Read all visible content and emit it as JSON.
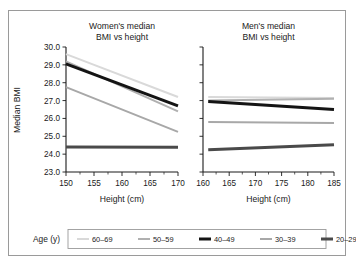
{
  "figure": {
    "panels": [
      {
        "id": "women",
        "title_line1": "Women's median",
        "title_line2": "BMI vs height",
        "xlabel": "Height (cm)",
        "xticks": [
          "150",
          "155",
          "160",
          "165",
          "170"
        ]
      },
      {
        "id": "men",
        "title_line1": "Men's median",
        "title_line2": "BMI vs height",
        "xlabel": "Height (cm)",
        "xticks": [
          "160",
          "165",
          "170",
          "175",
          "180",
          "185"
        ]
      }
    ],
    "ylabel": "Median BMI",
    "yticks": [
      "30.0",
      "29.0",
      "28.0",
      "27.0",
      "26.0",
      "25.0",
      "24.0",
      "23.0"
    ],
    "legend": {
      "title": "Age (y)",
      "entries": [
        {
          "label": "60–69",
          "color": "#d9d9d9",
          "width": 2.0
        },
        {
          "label": "50–59",
          "color": "#b0b0b0",
          "width": 2.0
        },
        {
          "label": "40–49",
          "color": "#141414",
          "width": 3.0
        },
        {
          "label": "30–39",
          "color": "#a8a8a8",
          "width": 2.0
        },
        {
          "label": "20–29",
          "color": "#4a4a4a",
          "width": 3.0
        }
      ]
    }
  },
  "chart_data": {
    "type": "line",
    "ylabel": "Median BMI",
    "ylim": [
      23.0,
      30.0
    ],
    "ytick_values": [
      30.0,
      29.0,
      28.0,
      27.0,
      26.0,
      25.0,
      24.0,
      23.0
    ],
    "grid": false,
    "legend_position": "bottom",
    "panels": [
      {
        "name": "Women's median BMI vs height",
        "xlabel": "Height (cm)",
        "xlim": [
          150,
          170
        ],
        "xtick_values": [
          150,
          155,
          160,
          165,
          170
        ],
        "series": [
          {
            "name": "60–69",
            "x": [
              150,
              170
            ],
            "values": [
              29.6,
              27.2
            ]
          },
          {
            "name": "50–59",
            "x": [
              150,
              170
            ],
            "values": [
              29.2,
              26.4
            ]
          },
          {
            "name": "40–49",
            "x": [
              150,
              170
            ],
            "values": [
              29.05,
              26.7
            ]
          },
          {
            "name": "30–39",
            "x": [
              150,
              170
            ],
            "values": [
              27.75,
              25.25
            ]
          },
          {
            "name": "20–29",
            "x": [
              150,
              170
            ],
            "values": [
              24.4,
              24.38
            ]
          }
        ]
      },
      {
        "name": "Men's median BMI vs height",
        "xlabel": "Height (cm)",
        "xlim": [
          160,
          185
        ],
        "xtick_values": [
          160,
          165,
          170,
          175,
          180,
          185
        ],
        "series": [
          {
            "name": "60–69",
            "x": [
              161,
              185
            ],
            "values": [
              27.2,
              27.15
            ]
          },
          {
            "name": "50–59",
            "x": [
              161,
              185
            ],
            "values": [
              27.0,
              27.1
            ]
          },
          {
            "name": "40–49",
            "x": [
              161,
              185
            ],
            "values": [
              26.95,
              26.5
            ]
          },
          {
            "name": "30–39",
            "x": [
              161,
              185
            ],
            "values": [
              25.8,
              25.75
            ]
          },
          {
            "name": "20–29",
            "x": [
              161,
              185
            ],
            "values": [
              24.25,
              24.52
            ]
          }
        ]
      }
    ]
  }
}
